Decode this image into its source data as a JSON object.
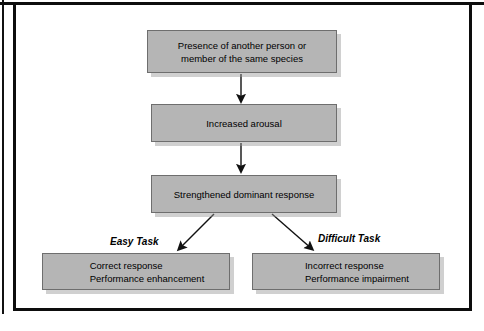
{
  "figure": {
    "background_color": "#ffffff",
    "frame_color": "#0d0d0d",
    "node_fill_color": "#b5b5b5",
    "node_border_color": "#6e6e6e",
    "arrow_color": "#111111"
  },
  "nodes": [
    {
      "id": "presence",
      "label": "Presence of another person or\nmember of the same species"
    },
    {
      "id": "arousal",
      "label": "Increased arousal"
    },
    {
      "id": "dominant",
      "label": "Strengthened dominant response"
    },
    {
      "id": "easy-outcome",
      "label": "Correct response\nPerformance enhancement"
    },
    {
      "id": "difficult-outcome",
      "label": "Incorrect response\nPerformance impairment"
    }
  ],
  "branch_labels": {
    "easy": "Easy Task",
    "difficult": "Difficult Task"
  }
}
